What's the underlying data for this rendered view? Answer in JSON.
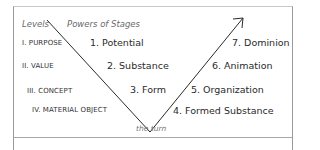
{
  "header": {
    "levels_label": "Levels",
    "powers_label": "Powers of Stages"
  },
  "levels": [
    {
      "label": "I. PURPOSE"
    },
    {
      "label": "II. VALUE"
    },
    {
      "label": "III. CONCEPT"
    },
    {
      "label": "IV. MATERIAL OBJECT"
    }
  ],
  "stages": [
    {
      "label": "1. Potential"
    },
    {
      "label": "2. Substance"
    },
    {
      "label": "3. Form"
    },
    {
      "label": "4. Formed Substance"
    },
    {
      "label": "5. Organization"
    },
    {
      "label": "6. Animation"
    },
    {
      "label": "7. Dominion"
    }
  ],
  "turn_label": "the turn",
  "colors": {
    "line": "#2a2a2a",
    "border": "#9a9a9a"
  }
}
